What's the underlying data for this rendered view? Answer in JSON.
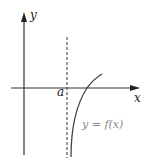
{
  "diagram": {
    "type": "function-graph-vertical-asymptote",
    "axes": {
      "x_label": "x",
      "y_label": "y",
      "axis_color": "#333333"
    },
    "asymptote": {
      "label": "a",
      "style": "dashed",
      "color": "#555555"
    },
    "curve": {
      "label": "y = f(x)",
      "color": "#444444",
      "label_color": "#888888"
    }
  }
}
